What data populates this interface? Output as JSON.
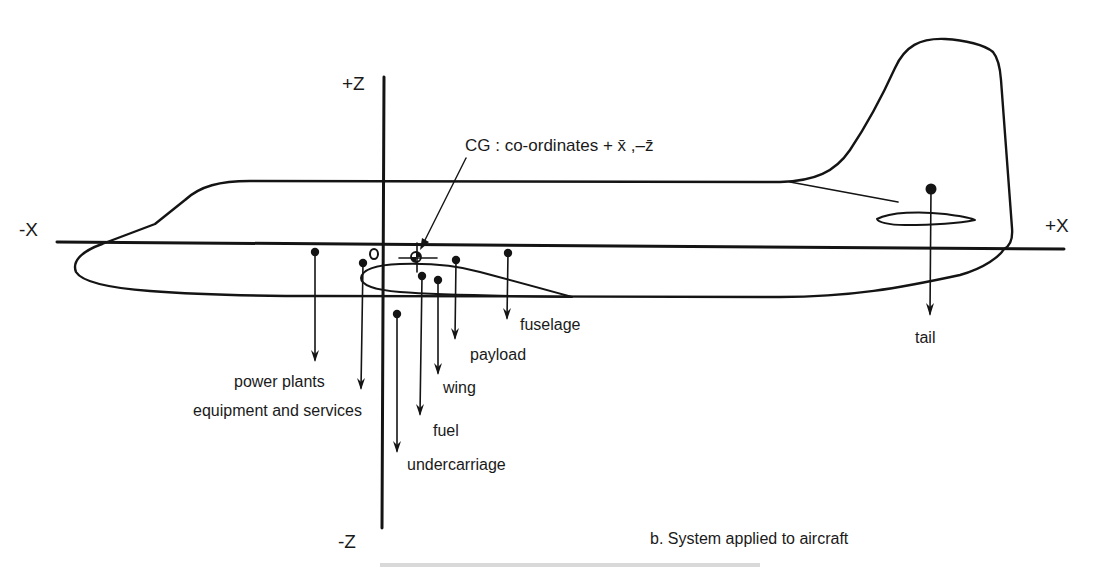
{
  "axes": {
    "neg_x": "-X",
    "pos_x": "+X",
    "pos_z": "+Z",
    "neg_z": "-Z",
    "origin": "O"
  },
  "cg": {
    "label": "CG :  co-ordinates + x̄ ,–z̄"
  },
  "weights": {
    "power_plants": "power plants",
    "equipment": "equipment and services",
    "undercarriage": "undercarriage",
    "fuel": "fuel",
    "wing": "wing",
    "payload": "payload",
    "fuselage": "fuselage",
    "tail": "tail"
  },
  "caption": {
    "subfigure": "b.  System applied to aircraft"
  },
  "colors": {
    "ink": "#141414",
    "paper": "#ffffff"
  }
}
